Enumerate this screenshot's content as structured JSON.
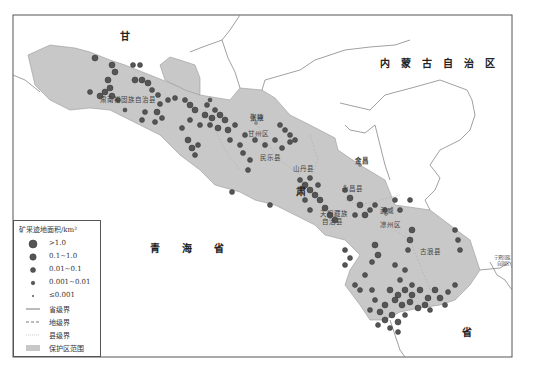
{
  "map": {
    "frame": {
      "x": 13,
      "y": 15,
      "w": 499,
      "h": 342
    },
    "colors": {
      "reserve_fill": "#c8c8c8",
      "dot_fill": "#555555",
      "dot_stroke": "#333333",
      "border": "#777777"
    },
    "province_labels": [
      {
        "text": "甘",
        "x": 120,
        "y": 28
      },
      {
        "text": "肃",
        "x": 298,
        "y": 186
      },
      {
        "text": "省",
        "x": 462,
        "y": 327
      },
      {
        "text": "内蒙古自治区",
        "x": 380,
        "y": 54
      },
      {
        "text": "青海省",
        "x": 150,
        "y": 243
      }
    ],
    "place_labels": [
      {
        "text": "肃南裕固族自治县",
        "x": 100,
        "y": 97
      },
      {
        "text": "张掖",
        "x": 250,
        "y": 118
      },
      {
        "text": "甘州区",
        "x": 248,
        "y": 130
      },
      {
        "text": "民乐县",
        "x": 260,
        "y": 153
      },
      {
        "text": "山丹县",
        "x": 293,
        "y": 163
      },
      {
        "text": "金昌",
        "x": 355,
        "y": 159
      },
      {
        "text": "永昌县",
        "x": 342,
        "y": 184
      },
      {
        "text": "天祝藏族",
        "x": 320,
        "y": 209
      },
      {
        "text": "自治县",
        "x": 322,
        "y": 218
      },
      {
        "text": "武威",
        "x": 380,
        "y": 208
      },
      {
        "text": "凉州区",
        "x": 380,
        "y": 222
      },
      {
        "text": "古浪县",
        "x": 420,
        "y": 249
      },
      {
        "text": "宁夏回族",
        "x": 505,
        "y": 256
      },
      {
        "text": "自治区",
        "x": 507,
        "y": 262
      }
    ]
  },
  "legend": {
    "title": "矿采迹地面积/km²",
    "items": [
      {
        "symbol": "dot-xl",
        "label": ">1.0"
      },
      {
        "symbol": "dot-l",
        "label": "0.1~1.0"
      },
      {
        "symbol": "dot-m",
        "label": "0.01~0.1"
      },
      {
        "symbol": "dot-s",
        "label": "0.001~0.01"
      },
      {
        "symbol": "dot-xs",
        "label": "≤0.001"
      },
      {
        "symbol": "line-solid",
        "label": "省级界"
      },
      {
        "symbol": "line-dashed",
        "label": "地级界"
      },
      {
        "symbol": "line-dotted",
        "label": "县级界"
      },
      {
        "symbol": "area-fill",
        "label": "保护区范围"
      }
    ]
  }
}
